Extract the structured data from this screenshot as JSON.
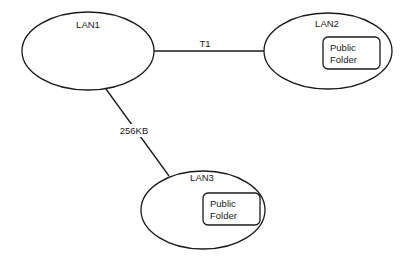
{
  "diagram": {
    "nodes": [
      {
        "id": "lan1",
        "label": "LAN1",
        "folder": null
      },
      {
        "id": "lan2",
        "label": "LAN2",
        "folder": {
          "line1": "Public",
          "line2": "Folder"
        }
      },
      {
        "id": "lan3",
        "label": "LAN3",
        "folder": {
          "line1": "Public",
          "line2": "Folder"
        }
      }
    ],
    "edges": [
      {
        "from": "lan1",
        "to": "lan2",
        "label": "T1"
      },
      {
        "from": "lan1",
        "to": "lan3",
        "label": "256KB"
      }
    ]
  }
}
